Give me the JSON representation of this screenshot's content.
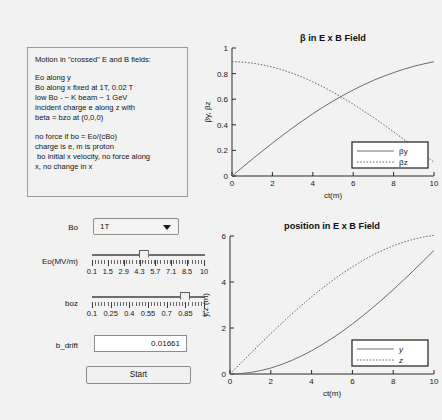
{
  "app": {
    "background": "#f2f2f2"
  },
  "info_panel": {
    "name": "description-panel",
    "lines": [
      "Motion in \"crossed\" E and B fields:",
      "",
      "Eo along y",
      "Bo along x fixed at 1T, 0.02 T",
      "low Bo - ~ K beam ~ 1 GeV",
      "incident charge e along z with",
      "beta = bzo at (0,0,0)",
      "",
      "no force if bo = Eo/(cBo)",
      "charge is e, m is proton",
      " bo initial x velocity, no force along",
      "x, no change in x"
    ]
  },
  "controls": {
    "bo": {
      "label": "Bo",
      "value": "1T",
      "options": [
        "1T",
        "0.02 T"
      ],
      "icon": "chevron-down-icon"
    },
    "eo": {
      "label": "Eo(MV/m)",
      "min": 0.1,
      "max": 10,
      "value": 4.6,
      "tick_labels": [
        "0.1",
        "1.5",
        "2.9",
        "4.3",
        "5.7",
        "7.1",
        "8.5",
        "10"
      ],
      "tick_values": [
        0.1,
        1.5,
        2.9,
        4.3,
        5.7,
        7.1,
        8.5,
        10
      ]
    },
    "boz": {
      "label": "boz",
      "min": 0.1,
      "max": 1,
      "value": 0.87,
      "tick_labels": [
        "0.1",
        "0.25",
        "0.4",
        "0.55",
        "0.7",
        "0.85",
        "1"
      ],
      "tick_values": [
        0.1,
        0.25,
        0.4,
        0.55,
        0.7,
        0.85,
        1
      ]
    },
    "b_drift": {
      "label": "b_drift",
      "value": "0.01661"
    },
    "start": {
      "label": "Start"
    }
  },
  "chart_data": [
    {
      "id": "beta",
      "type": "line",
      "title": "β in E x B Field",
      "xlabel": "ct(m)",
      "ylabel": "βy, βz",
      "xlim": [
        0,
        10
      ],
      "ylim": [
        0,
        1
      ],
      "xticks": [
        0,
        2,
        4,
        6,
        8,
        10
      ],
      "yticks": [
        0,
        0.2,
        0.4,
        0.6,
        0.8,
        1
      ],
      "grid": false,
      "legend_position": "lower-right",
      "series": [
        {
          "name": "βy",
          "style": "solid",
          "x": [
            0,
            0.5,
            1,
            1.5,
            2,
            2.5,
            3,
            3.5,
            4,
            4.5,
            5,
            5.5,
            6,
            6.5,
            7,
            7.5,
            8,
            8.5,
            9,
            9.5,
            10
          ],
          "y": [
            0.0,
            0.066,
            0.131,
            0.195,
            0.257,
            0.318,
            0.376,
            0.432,
            0.486,
            0.537,
            0.585,
            0.63,
            0.672,
            0.711,
            0.747,
            0.779,
            0.808,
            0.834,
            0.857,
            0.876,
            0.893
          ]
        },
        {
          "name": "βz",
          "style": "dotted",
          "x": [
            0,
            0.5,
            1,
            1.5,
            2,
            2.5,
            3,
            3.5,
            4,
            4.5,
            5,
            5.5,
            6,
            6.5,
            7,
            7.5,
            8,
            8.5,
            9,
            9.5,
            10
          ],
          "y": [
            0.893,
            0.89,
            0.882,
            0.869,
            0.851,
            0.829,
            0.802,
            0.771,
            0.736,
            0.697,
            0.655,
            0.609,
            0.561,
            0.51,
            0.457,
            0.402,
            0.345,
            0.287,
            0.228,
            0.168,
            0.108
          ]
        }
      ]
    },
    {
      "id": "position",
      "type": "line",
      "title": "position in E x B Field",
      "xlabel": "ct(m)",
      "ylabel": "y,z (m)",
      "xlim": [
        0,
        10
      ],
      "ylim": [
        0,
        6
      ],
      "xticks": [
        0,
        2,
        4,
        6,
        8,
        10
      ],
      "yticks": [
        0,
        2,
        4,
        6
      ],
      "grid": false,
      "legend_position": "lower-right",
      "series": [
        {
          "name": "y",
          "style": "solid",
          "x": [
            0,
            0.5,
            1,
            1.5,
            2,
            2.5,
            3,
            3.5,
            4,
            4.5,
            5,
            5.5,
            6,
            6.5,
            7,
            7.5,
            8,
            8.5,
            9,
            9.5,
            10
          ],
          "y": [
            0.0,
            0.017,
            0.066,
            0.148,
            0.261,
            0.405,
            0.579,
            0.781,
            1.011,
            1.267,
            1.547,
            1.851,
            2.177,
            2.523,
            2.888,
            3.27,
            3.667,
            4.078,
            4.501,
            4.935,
            5.377
          ]
        },
        {
          "name": "z",
          "style": "dotted",
          "x": [
            0,
            0.5,
            1,
            1.5,
            2,
            2.5,
            3,
            3.5,
            4,
            4.5,
            5,
            5.5,
            6,
            6.5,
            7,
            7.5,
            8,
            8.5,
            9,
            9.5,
            10
          ],
          "y": [
            0.0,
            0.446,
            0.89,
            1.328,
            1.758,
            2.178,
            2.586,
            2.979,
            3.356,
            3.715,
            4.053,
            4.369,
            4.662,
            4.93,
            5.172,
            5.387,
            5.573,
            5.731,
            5.86,
            5.959,
            6.028
          ]
        }
      ]
    }
  ]
}
